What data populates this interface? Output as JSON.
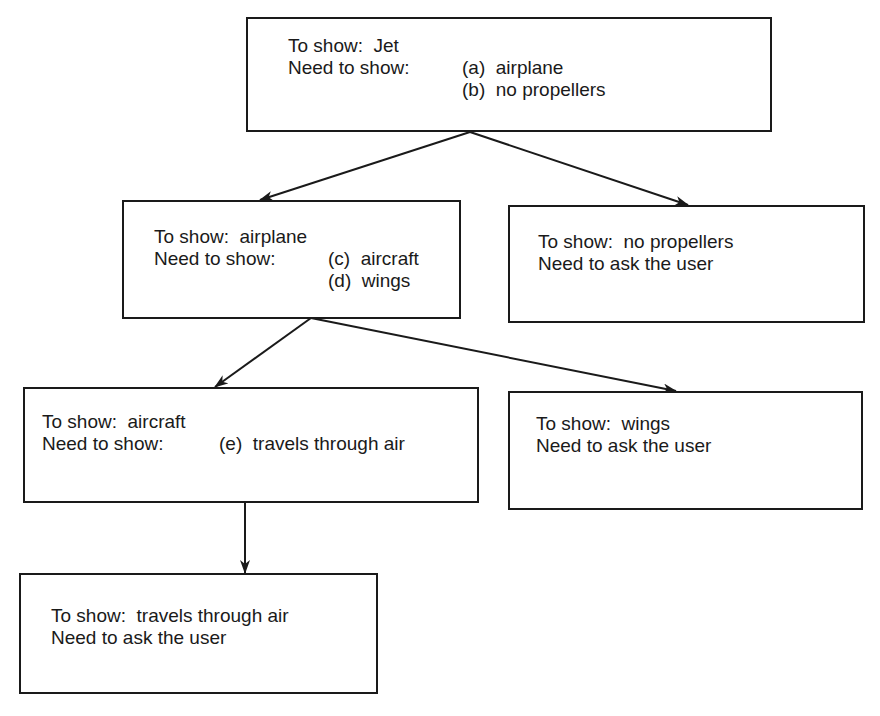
{
  "diagram": {
    "nodes": [
      {
        "id": "jet",
        "to_show_label": "To show:  Jet",
        "need_label": "Need to show:",
        "items": [
          "(a)  airplane",
          "(b)  no propellers"
        ]
      },
      {
        "id": "airplane",
        "to_show_label": "To show:  airplane",
        "need_label": "Need to show:",
        "items": [
          "(c)  aircraft",
          "(d)  wings"
        ]
      },
      {
        "id": "no-propellers",
        "to_show_label": "To show:  no propellers",
        "need_label": "Need to ask the user"
      },
      {
        "id": "aircraft",
        "to_show_label": "To show:  aircraft",
        "need_label": "Need to show:",
        "items": [
          "(e)  travels through air"
        ]
      },
      {
        "id": "wings",
        "to_show_label": "To show:  wings",
        "need_label": "Need to ask the user"
      },
      {
        "id": "travels-through-air",
        "to_show_label": "To show:  travels through air",
        "need_label": "Need to ask the user"
      }
    ],
    "edges": [
      {
        "from": "jet",
        "to": "airplane"
      },
      {
        "from": "jet",
        "to": "no-propellers"
      },
      {
        "from": "airplane",
        "to": "aircraft"
      },
      {
        "from": "airplane",
        "to": "wings"
      },
      {
        "from": "aircraft",
        "to": "travels-through-air"
      }
    ],
    "colors": {
      "stroke": "#1a1a1a",
      "background": "#ffffff"
    }
  }
}
